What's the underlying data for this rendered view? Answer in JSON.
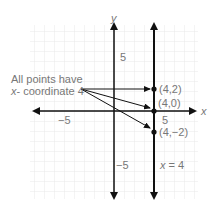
{
  "axes": {
    "x_label": "x",
    "y_label": "y",
    "x_ticks": [
      "−5",
      "5"
    ],
    "y_ticks": [
      "5",
      "−5"
    ]
  },
  "annotation": {
    "line1": "All points have",
    "line2_italic": "x",
    "line2_rest": "- coordinate 4"
  },
  "points": [
    {
      "label": "(4,2)",
      "x": 4,
      "y": 2
    },
    {
      "label": "(4,0)",
      "x": 4,
      "y": 0
    },
    {
      "label": "(4,−2)",
      "x": 4,
      "y": -2
    }
  ],
  "line_label": {
    "var": "x",
    "rest": " = 4"
  },
  "colors": {
    "grid": "#dddddd",
    "axis": "#111111",
    "text": "#777777"
  }
}
